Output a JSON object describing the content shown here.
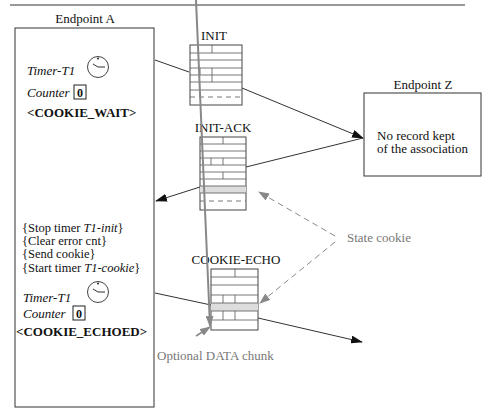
{
  "endpoint_a": {
    "title": "Endpoint A",
    "state1": {
      "timer_label": "Timer-T1",
      "counter_label": "Counter",
      "counter_value": "0",
      "state": "<COOKIE_WAIT>"
    },
    "actions": [
      {
        "pre": "{Stop timer ",
        "em": "T1-init",
        "post": "}"
      },
      {
        "pre": "{Clear error cnt}",
        "em": "",
        "post": ""
      },
      {
        "pre": "{Send cookie}",
        "em": "",
        "post": ""
      },
      {
        "pre": "{Start timer ",
        "em": "T1-cookie",
        "post": "}"
      }
    ],
    "state2": {
      "timer_label": "Timer-T1",
      "counter_label": "Counter",
      "counter_value": "0",
      "state": "<COOKIE_ECHOED>"
    }
  },
  "endpoint_z": {
    "title": "Endpoint Z",
    "line1": "No record kept",
    "line2": "of the association"
  },
  "packets": {
    "init": "INIT",
    "init_ack": "INIT-ACK",
    "cookie_echo": "COOKIE-ECHO"
  },
  "annotations": {
    "state_cookie": "State cookie",
    "optional_data": "Optional DATA chunk"
  },
  "colors": {
    "line": "#222222",
    "annotation": "#888888",
    "cookie_fill": "#dddddd"
  }
}
